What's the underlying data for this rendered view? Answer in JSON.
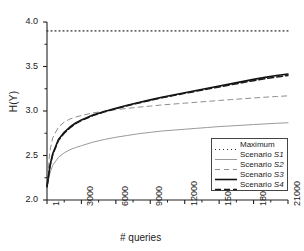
{
  "chart_data": {
    "type": "line",
    "title": "",
    "xlabel": "# queries",
    "ylabel": "H(Y)",
    "xlim": [
      1,
      21000
    ],
    "ylim": [
      2.0,
      4.0
    ],
    "grid": false,
    "legend_position": "lower-right",
    "xticks": [
      1,
      3000,
      6000,
      9000,
      12000,
      15000,
      18000,
      21000
    ],
    "xtick_labels": [
      "1",
      "3000",
      "6000",
      "9000",
      "12000",
      "15000",
      "18000",
      "21000"
    ],
    "yticks": [
      2.0,
      2.5,
      3.0,
      3.5,
      4.0
    ],
    "ytick_labels": [
      "2.0",
      "2.5",
      "3.0",
      "3.5",
      "4.0"
    ],
    "x": [
      1,
      250,
      500,
      1000,
      1500,
      2000,
      2500,
      3000,
      4000,
      5000,
      6000,
      7000,
      8000,
      9000,
      10000,
      11000,
      12000,
      13000,
      14000,
      15000,
      16000,
      17000,
      18000,
      19000,
      20000,
      21000
    ],
    "series": [
      {
        "name": "Maximum",
        "label": "Maximum",
        "style": "dotted",
        "color": "#2b2b2b",
        "width": 1.1,
        "values": [
          3.9,
          3.9,
          3.9,
          3.9,
          3.9,
          3.9,
          3.9,
          3.9,
          3.9,
          3.9,
          3.9,
          3.9,
          3.9,
          3.9,
          3.9,
          3.9,
          3.9,
          3.9,
          3.9,
          3.9,
          3.9,
          3.9,
          3.9,
          3.9,
          3.9,
          3.9
        ]
      },
      {
        "name": "Scenario S1",
        "label_prefix": "Scenario ",
        "label_italic": "S1",
        "style": "solid",
        "color": "#9a9a9a",
        "width": 1.0,
        "values": [
          2.15,
          2.3,
          2.39,
          2.48,
          2.53,
          2.565,
          2.59,
          2.61,
          2.65,
          2.68,
          2.705,
          2.725,
          2.745,
          2.76,
          2.775,
          2.785,
          2.795,
          2.805,
          2.815,
          2.825,
          2.832,
          2.84,
          2.848,
          2.855,
          2.862,
          2.868
        ]
      },
      {
        "name": "Scenario S2",
        "label_prefix": "Scenario ",
        "label_italic": "S2",
        "style": "dashed",
        "color": "#8e8e8e",
        "width": 1.0,
        "values": [
          2.16,
          2.55,
          2.7,
          2.82,
          2.875,
          2.91,
          2.932,
          2.95,
          2.978,
          2.998,
          3.015,
          3.03,
          3.043,
          3.055,
          3.068,
          3.078,
          3.088,
          3.098,
          3.108,
          3.118,
          3.128,
          3.137,
          3.146,
          3.155,
          3.163,
          3.17
        ]
      },
      {
        "name": "Scenario S3",
        "label_prefix": "Scenario ",
        "label_italic": "S3",
        "style": "solid",
        "color": "#111111",
        "width": 1.6,
        "values": [
          2.15,
          2.38,
          2.52,
          2.68,
          2.76,
          2.82,
          2.865,
          2.9,
          2.955,
          2.995,
          3.03,
          3.065,
          3.095,
          3.125,
          3.155,
          3.18,
          3.205,
          3.23,
          3.255,
          3.28,
          3.305,
          3.33,
          3.355,
          3.378,
          3.398,
          3.415
        ]
      },
      {
        "name": "Scenario S4",
        "label_prefix": "Scenario ",
        "label_italic": "S4",
        "style": "dashed-bold",
        "color": "#1a1a1a",
        "width": 1.5,
        "values": [
          2.15,
          2.37,
          2.51,
          2.67,
          2.75,
          2.81,
          2.858,
          2.893,
          2.948,
          2.99,
          3.025,
          3.06,
          3.09,
          3.12,
          3.148,
          3.173,
          3.198,
          3.222,
          3.246,
          3.27,
          3.294,
          3.318,
          3.34,
          3.362,
          3.382,
          3.4
        ]
      }
    ]
  },
  "legend": {
    "items": [
      {
        "label": "Maximum",
        "italic": ""
      },
      {
        "label": "Scenario ",
        "italic": "S1"
      },
      {
        "label": "Scenario ",
        "italic": "S2"
      },
      {
        "label": "Scenario ",
        "italic": "S3"
      },
      {
        "label": "Scenario ",
        "italic": "S4"
      }
    ]
  },
  "axes": {
    "ylabel": "H(Y)",
    "xlabel": "# queries"
  }
}
